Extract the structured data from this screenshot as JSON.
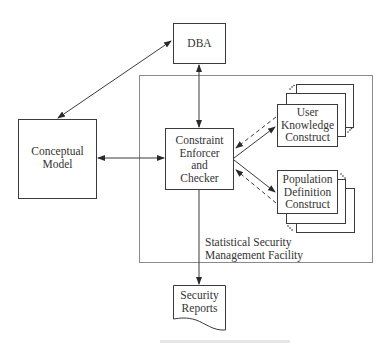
{
  "diagram": {
    "nodes": {
      "dba": {
        "label": "DBA"
      },
      "conceptual_model": {
        "line1": "Conceptual",
        "line2": "Model"
      },
      "constraint_enforcer": {
        "line1": "Constraint",
        "line2": "Enforcer",
        "line3": "and",
        "line4": "Checker"
      },
      "user_knowledge": {
        "line1": "User",
        "line2": "Knowledge",
        "line3": "Construct"
      },
      "population_definition": {
        "line1": "Population",
        "line2": "Definition",
        "line3": "Construct"
      },
      "security_reports": {
        "line1": "Security",
        "line2": "Reports"
      }
    },
    "container": {
      "line1": "Statistical Security",
      "line2": "Management Facility"
    },
    "edges": [
      {
        "from": "dba",
        "to": "conceptual_model",
        "type": "bidirectional"
      },
      {
        "from": "dba",
        "to": "constraint_enforcer",
        "type": "bidirectional"
      },
      {
        "from": "conceptual_model",
        "to": "constraint_enforcer",
        "type": "bidirectional"
      },
      {
        "from": "constraint_enforcer",
        "to": "user_knowledge",
        "type": "solid-arrow"
      },
      {
        "from": "user_knowledge",
        "to": "constraint_enforcer",
        "type": "dashed-arrow"
      },
      {
        "from": "constraint_enforcer",
        "to": "population_definition",
        "type": "solid-arrow"
      },
      {
        "from": "population_definition",
        "to": "constraint_enforcer",
        "type": "dashed-arrow"
      },
      {
        "from": "constraint_enforcer",
        "to": "security_reports",
        "type": "solid-arrow"
      }
    ],
    "colors": {
      "line": "#3a3a3a",
      "container": "#8a8a8a",
      "background": "#ffffff"
    }
  }
}
